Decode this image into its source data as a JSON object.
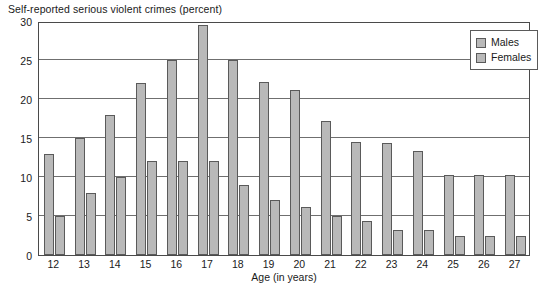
{
  "chart_data": {
    "type": "bar",
    "title": "Self-reported serious violent crimes (percent)",
    "xlabel": "Age (in years)",
    "ylabel": "",
    "ylim": [
      0,
      30
    ],
    "yticks": [
      0,
      5,
      10,
      15,
      20,
      25,
      30
    ],
    "grid": true,
    "legend_position": "top-right",
    "categories": [
      "12",
      "13",
      "14",
      "15",
      "16",
      "17",
      "18",
      "19",
      "20",
      "21",
      "22",
      "23",
      "24",
      "25",
      "26",
      "27"
    ],
    "series": [
      {
        "name": "Males",
        "color": "#b9b9b9",
        "values": [
          13.0,
          15.0,
          18.0,
          22.0,
          25.0,
          29.5,
          25.0,
          22.2,
          21.2,
          17.2,
          14.5,
          14.3,
          13.3,
          10.2,
          10.2,
          10.2
        ]
      },
      {
        "name": "Females",
        "color": "#b9b9b9",
        "values": [
          5.0,
          8.0,
          10.0,
          12.0,
          12.0,
          12.0,
          9.0,
          7.0,
          6.2,
          5.0,
          4.3,
          3.2,
          3.2,
          2.4,
          2.4,
          2.4
        ]
      }
    ]
  }
}
